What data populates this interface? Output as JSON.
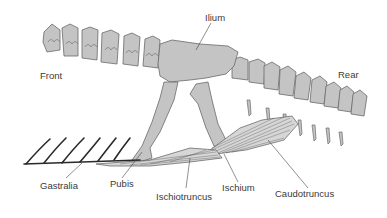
{
  "diagram": {
    "colors": {
      "bone_fill": "#c4c4c4",
      "bone_stroke": "#6a6a6a",
      "muscle_fill": "#d6d6d6",
      "muscle_line": "#5a5a5a",
      "gastralia": "#2a2a2a",
      "label_text": "#3a3a3a",
      "leader_line": "#444444",
      "background": "#ffffff"
    },
    "orientation": {
      "front": "Front",
      "rear": "Rear"
    },
    "labels": {
      "ilium": "Ilium",
      "pubis": "Pubis",
      "ischium": "Ischium",
      "gastralia": "Gastralia",
      "ischiotruncus": "Ischiotruncus",
      "caudotruncus": "Caudotruncus"
    }
  }
}
